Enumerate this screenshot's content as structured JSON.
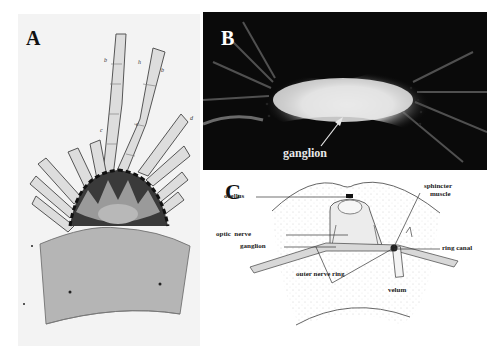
{
  "figure": {
    "panels": [
      {
        "id": "A",
        "label": "A",
        "description": "Historical drawing of a jellyfish marginal region: radiating segmented tentacles above a dark spiky ganglion, with the velum/bell margin below",
        "annotations": [
          "h",
          "b",
          "b",
          "c",
          "c",
          "d"
        ]
      },
      {
        "id": "B",
        "label": "B",
        "description": "Fluorescence micrograph on black background showing a bright elongated ganglion structure with radiating fibers",
        "annotations": [
          {
            "text": "ganglion",
            "arrow": true
          }
        ]
      },
      {
        "id": "C",
        "label": "C",
        "description": "Schematic line drawing of rhopalium region",
        "annotations": [
          {
            "text": "ocellus"
          },
          {
            "text": "optic  nerve"
          },
          {
            "text": "ganglion"
          },
          {
            "text": "outer nerve ring"
          },
          {
            "text": "sphincter"
          },
          {
            "text": "muscle"
          },
          {
            "text": "ring canal"
          },
          {
            "text": "velum"
          }
        ]
      }
    ]
  },
  "colors": {
    "panel_b_background": "#0a0a0a",
    "panel_a_background": "#f3f3f3",
    "ink": "#222222"
  }
}
